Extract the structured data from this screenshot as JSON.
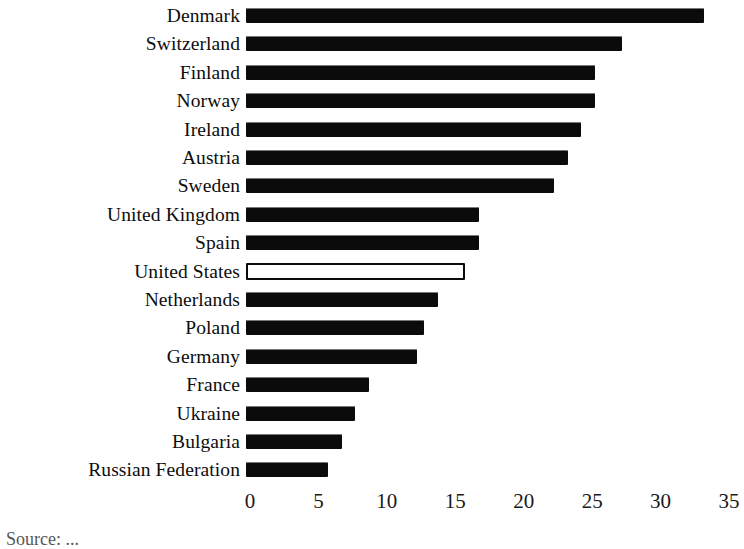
{
  "chart_data": {
    "type": "bar",
    "orientation": "horizontal",
    "title": "",
    "subtitle": "",
    "xlabel": "",
    "ylabel": "",
    "xlim": [
      0,
      35
    ],
    "xticks": [
      0,
      5,
      10,
      15,
      20,
      25,
      30,
      35
    ],
    "xtick_labels": [
      "0",
      "5",
      "10",
      "15",
      "20",
      "25",
      "30",
      "35"
    ],
    "grid": false,
    "legend": false,
    "legend_position": "none",
    "highlight_category": "United States",
    "highlight_style": "hollow-outline",
    "categories": [
      "Denmark",
      "Switzerland",
      "Finland",
      "Norway",
      "Ireland",
      "Austria",
      "Sweden",
      "United Kingdom",
      "Spain",
      "United States",
      "Netherlands",
      "Poland",
      "Germany",
      "France",
      "Ukraine",
      "Bulgaria",
      "Russian Federation"
    ],
    "values": [
      33.5,
      27.5,
      25.5,
      25.5,
      24.5,
      23.5,
      22.5,
      17.0,
      17.0,
      16.0,
      14.0,
      13.0,
      12.5,
      9.0,
      8.0,
      7.0,
      6.0
    ],
    "bars": [
      {
        "label": "Denmark",
        "value": 33.5,
        "filled": true
      },
      {
        "label": "Switzerland",
        "value": 27.5,
        "filled": true
      },
      {
        "label": "Finland",
        "value": 25.5,
        "filled": true
      },
      {
        "label": "Norway",
        "value": 25.5,
        "filled": true
      },
      {
        "label": "Ireland",
        "value": 24.5,
        "filled": true
      },
      {
        "label": "Austria",
        "value": 23.5,
        "filled": true
      },
      {
        "label": "Sweden",
        "value": 22.5,
        "filled": true
      },
      {
        "label": "United Kingdom",
        "value": 17.0,
        "filled": true
      },
      {
        "label": "Spain",
        "value": 17.0,
        "filled": true
      },
      {
        "label": "United States",
        "value": 16.0,
        "filled": false
      },
      {
        "label": "Netherlands",
        "value": 14.0,
        "filled": true
      },
      {
        "label": "Poland",
        "value": 13.0,
        "filled": true
      },
      {
        "label": "Germany",
        "value": 12.5,
        "filled": true
      },
      {
        "label": "France",
        "value": 9.0,
        "filled": true
      },
      {
        "label": "Ukraine",
        "value": 8.0,
        "filled": true
      },
      {
        "label": "Bulgaria",
        "value": 7.0,
        "filled": true
      },
      {
        "label": "Russian Federation",
        "value": 6.0,
        "filled": true
      }
    ],
    "colors": {
      "bar_fill": "#0b0b0b",
      "bar_outline": "#0b0b0b",
      "background": "#ffffff",
      "text": "#111111"
    }
  },
  "caption": {
    "text": "Source: ..."
  }
}
